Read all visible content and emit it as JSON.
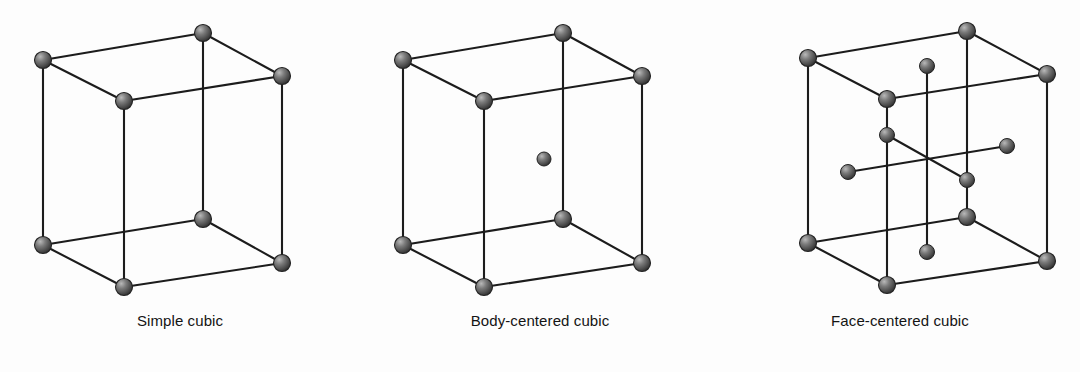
{
  "figure": {
    "background_color": "#fdfdfd",
    "line_color": "#1c1c1c",
    "atom_color_dark": "#4a4a4a",
    "atom_color_mid": "#5d5d5d",
    "atom_color_highlight": "#b9b9b9",
    "atom_outline_color": "#232323"
  },
  "cells": [
    {
      "id": "simple-cubic",
      "caption": "Simple cubic",
      "atom_count": 8,
      "atom_radius": 8.5,
      "geometry": {
        "front_top_left": [
          43,
          60
        ],
        "front_top_right": [
          282,
          76
        ],
        "back_top_left": [
          124,
          101
        ],
        "back_top_right": [
          203,
          33
        ],
        "front_bot_left": [
          43,
          245
        ],
        "front_bot_right": [
          282,
          263
        ],
        "back_bot_left": [
          124,
          287
        ],
        "back_bot_right": [
          203,
          219
        ]
      },
      "atoms": [
        {
          "name": "corner-top-back",
          "x": 203,
          "y": 33,
          "r": 8.5
        },
        {
          "name": "corner-top-left",
          "x": 43,
          "y": 60,
          "r": 8.5
        },
        {
          "name": "corner-top-right",
          "x": 282,
          "y": 76,
          "r": 8.5
        },
        {
          "name": "corner-top-front",
          "x": 124,
          "y": 101,
          "r": 8.5
        },
        {
          "name": "corner-bottom-back",
          "x": 203,
          "y": 219,
          "r": 8.5
        },
        {
          "name": "corner-bottom-left",
          "x": 43,
          "y": 245,
          "r": 8.5
        },
        {
          "name": "corner-bottom-right",
          "x": 282,
          "y": 263,
          "r": 8.5
        },
        {
          "name": "corner-bottom-front",
          "x": 124,
          "y": 287,
          "r": 8.5
        }
      ]
    },
    {
      "id": "body-centered-cubic",
      "caption": "Body-centered cubic",
      "atom_count": 9,
      "atom_radius": 8.5,
      "center_atom_radius": 7.0,
      "geometry": {
        "front_top_left": [
          43,
          60
        ],
        "front_top_right": [
          282,
          76
        ],
        "back_top_left": [
          124,
          101
        ],
        "back_top_right": [
          203,
          33
        ],
        "front_bot_left": [
          43,
          245
        ],
        "front_bot_right": [
          282,
          263
        ],
        "back_bot_left": [
          124,
          287
        ],
        "back_bot_right": [
          203,
          219
        ],
        "body_center": [
          184,
          159
        ]
      },
      "atoms": [
        {
          "name": "corner-top-back",
          "x": 203,
          "y": 33,
          "r": 8.5
        },
        {
          "name": "corner-top-left",
          "x": 43,
          "y": 60,
          "r": 8.5
        },
        {
          "name": "corner-top-right",
          "x": 282,
          "y": 76,
          "r": 8.5
        },
        {
          "name": "corner-top-front",
          "x": 124,
          "y": 101,
          "r": 8.5
        },
        {
          "name": "body-center",
          "x": 184,
          "y": 159,
          "r": 7.0
        },
        {
          "name": "corner-bottom-back",
          "x": 203,
          "y": 219,
          "r": 8.5
        },
        {
          "name": "corner-bottom-left",
          "x": 43,
          "y": 245,
          "r": 8.5
        },
        {
          "name": "corner-bottom-right",
          "x": 282,
          "y": 263,
          "r": 8.5
        },
        {
          "name": "corner-bottom-front",
          "x": 124,
          "y": 287,
          "r": 8.5
        }
      ]
    },
    {
      "id": "face-centered-cubic",
      "caption": "Face-centered cubic",
      "atom_count": 14,
      "atom_radius": 8.5,
      "face_atom_radius": 7.5,
      "geometry": {
        "front_top_left": [
          88,
          58
        ],
        "front_top_right": [
          327,
          74
        ],
        "back_top_left": [
          167,
          99
        ],
        "back_top_right": [
          247,
          31
        ],
        "front_bot_left": [
          88,
          243
        ],
        "front_bot_right": [
          327,
          261
        ],
        "back_bot_left": [
          167,
          285
        ],
        "back_bot_right": [
          247,
          217
        ],
        "face_top": [
          207,
          66
        ],
        "face_bottom": [
          207,
          252
        ],
        "face_left": [
          128,
          172
        ],
        "face_right": [
          287,
          146
        ],
        "face_front": [
          167,
          135
        ],
        "face_back": [
          247,
          180
        ]
      },
      "atoms": [
        {
          "name": "corner-top-back",
          "x": 247,
          "y": 31,
          "r": 8.5
        },
        {
          "name": "corner-top-left",
          "x": 88,
          "y": 58,
          "r": 8.5
        },
        {
          "name": "corner-top-right",
          "x": 327,
          "y": 74,
          "r": 8.5
        },
        {
          "name": "face-center-top",
          "x": 207,
          "y": 66,
          "r": 7.5
        },
        {
          "name": "corner-top-front",
          "x": 167,
          "y": 99,
          "r": 8.5
        },
        {
          "name": "face-center-front",
          "x": 167,
          "y": 135,
          "r": 7.5
        },
        {
          "name": "face-center-right",
          "x": 287,
          "y": 146,
          "r": 7.5
        },
        {
          "name": "face-center-left",
          "x": 128,
          "y": 172,
          "r": 7.5
        },
        {
          "name": "face-center-back",
          "x": 247,
          "y": 180,
          "r": 7.5
        },
        {
          "name": "corner-bottom-back",
          "x": 247,
          "y": 217,
          "r": 8.5
        },
        {
          "name": "corner-bottom-left",
          "x": 88,
          "y": 243,
          "r": 8.5
        },
        {
          "name": "face-center-bottom",
          "x": 207,
          "y": 252,
          "r": 7.5
        },
        {
          "name": "corner-bottom-right",
          "x": 327,
          "y": 261,
          "r": 8.5
        },
        {
          "name": "corner-bottom-front",
          "x": 167,
          "y": 285,
          "r": 8.5
        }
      ]
    }
  ]
}
